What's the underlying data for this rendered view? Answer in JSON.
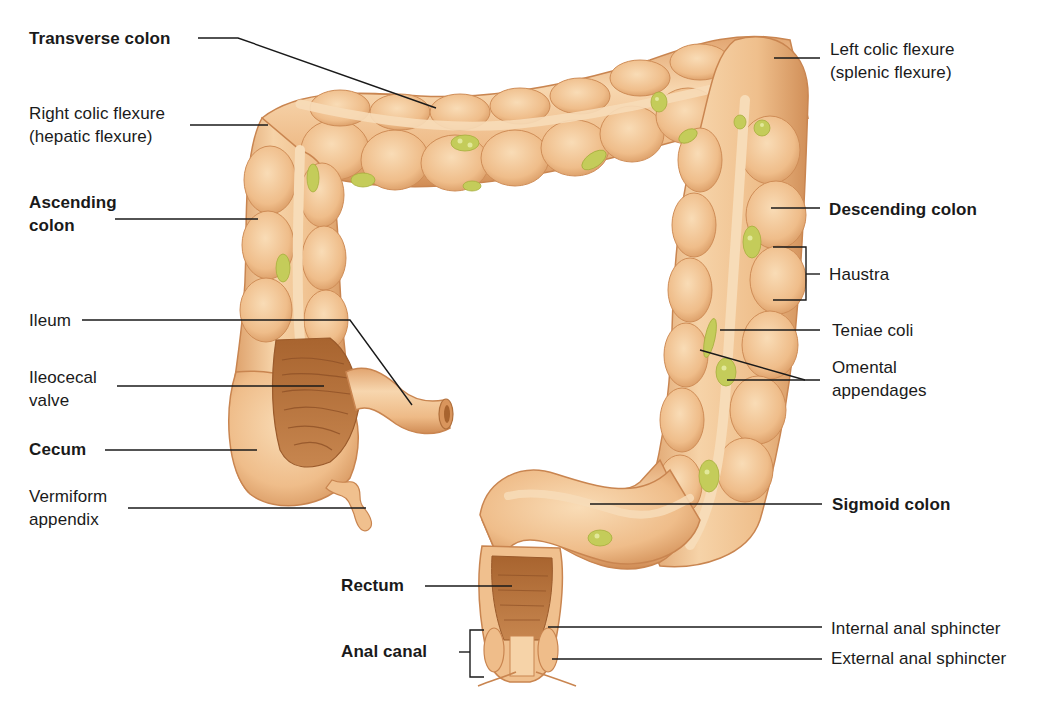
{
  "diagram": {
    "colors": {
      "tissue": "#f0c08e",
      "tissue_light": "#f7d6ae",
      "tissue_shadow": "#d99a63",
      "tissue_outline": "#c98550",
      "interior": "#b9733f",
      "interior_dark": "#8f5127",
      "teniae": "#f5d4ae",
      "fat_appendage": "#c4cc5a",
      "fat_highlight": "#e2e89a",
      "leader_line": "#1a1a1a",
      "background": "#ffffff"
    },
    "labels": {
      "left": [
        {
          "id": "transverse_colon",
          "text": "Transverse colon",
          "bold": true
        },
        {
          "id": "right_colic_flexure",
          "text": "Right colic flexure\n(hepatic flexure)",
          "bold": false
        },
        {
          "id": "ascending_colon",
          "text": "Ascending\ncolon",
          "bold": true
        },
        {
          "id": "ileum",
          "text": "Ileum",
          "bold": false
        },
        {
          "id": "ileocecal_valve",
          "text": "Ileocecal\nvalve",
          "bold": false
        },
        {
          "id": "cecum",
          "text": "Cecum",
          "bold": true
        },
        {
          "id": "vermiform_appendix",
          "text": "Vermiform\nappendix",
          "bold": false
        }
      ],
      "right": [
        {
          "id": "left_colic_flexure",
          "text": "Left colic flexure\n(splenic flexure)",
          "bold": false
        },
        {
          "id": "descending_colon",
          "text": "Descending colon",
          "bold": true
        },
        {
          "id": "haustra",
          "text": "Haustra",
          "bold": false
        },
        {
          "id": "teniae_coli",
          "text": "Teniae coli",
          "bold": false
        },
        {
          "id": "omental_appendages",
          "text": "Omental\nappendages",
          "bold": false
        },
        {
          "id": "sigmoid_colon",
          "text": "Sigmoid colon",
          "bold": true
        },
        {
          "id": "internal_anal_sphincter",
          "text": "Internal anal sphincter",
          "bold": false
        },
        {
          "id": "external_anal_sphincter",
          "text": "External anal sphincter",
          "bold": false
        }
      ],
      "bottom": [
        {
          "id": "rectum",
          "text": "Rectum",
          "bold": true
        },
        {
          "id": "anal_canal",
          "text": "Anal canal",
          "bold": true
        }
      ]
    }
  }
}
